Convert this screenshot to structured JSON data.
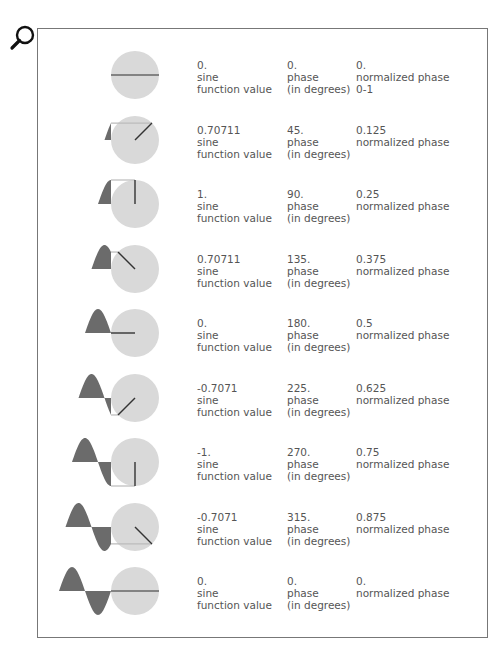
{
  "icon": {
    "name": "search-icon"
  },
  "colors": {
    "circle_fill": "#d9d9d9",
    "wave_fill": "#6b6b6b",
    "radius_line": "#333333",
    "projection_line": "#bbbbbb",
    "frame": "#777777",
    "text": "#555555"
  },
  "labels": {
    "sine_label": "sine",
    "function_value_label": "function value",
    "phase_label": "phase",
    "in_degrees_label": "(in degrees)",
    "normalized_label": "normalized phase"
  },
  "rows": [
    {
      "sine_value": "0.",
      "phase": "0.",
      "normalized": "0.",
      "range_note": "0-1",
      "deg": 0
    },
    {
      "sine_value": "0.70711",
      "phase": "45.",
      "normalized": "0.125",
      "range_note": "",
      "deg": 45
    },
    {
      "sine_value": "1.",
      "phase": "90.",
      "normalized": "0.25",
      "range_note": "",
      "deg": 90
    },
    {
      "sine_value": "0.70711",
      "phase": "135.",
      "normalized": "0.375",
      "range_note": "",
      "deg": 135
    },
    {
      "sine_value": "0.",
      "phase": "180.",
      "normalized": "0.5",
      "range_note": "",
      "deg": 180
    },
    {
      "sine_value": "-0.7071",
      "phase": "225.",
      "normalized": "0.625",
      "range_note": "",
      "deg": 225
    },
    {
      "sine_value": "-1.",
      "phase": "270.",
      "normalized": "0.75",
      "range_note": "",
      "deg": 270
    },
    {
      "sine_value": "-0.7071",
      "phase": "315.",
      "normalized": "0.875",
      "range_note": "",
      "deg": 315
    },
    {
      "sine_value": "0.",
      "phase": "0.",
      "normalized": "0.",
      "range_note": "",
      "deg": 360
    }
  ]
}
